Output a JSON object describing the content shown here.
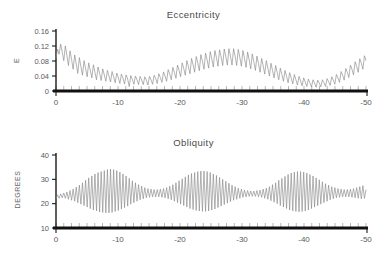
{
  "figure": {
    "background": "#ffffff",
    "curve_color": "#8a8a8a",
    "axis_color": "#111111",
    "text_color": "#5a5a5a"
  },
  "panels": [
    {
      "id": "eccentricity",
      "title": "Eccentricity",
      "ylabel": "E",
      "yticks": [
        "0",
        "0.04",
        "0.08",
        "0.12",
        "0.16"
      ],
      "xticks": [
        "0",
        "-10",
        "-20",
        "-30",
        "-40",
        "-50"
      ]
    },
    {
      "id": "obliquity",
      "title": "Obliquity",
      "ylabel": "DEGREES",
      "yticks": [
        "10",
        "20",
        "30",
        "40"
      ],
      "xticks": [
        "0",
        "-10",
        "-20",
        "-30",
        "-40",
        "-50"
      ]
    }
  ],
  "chart_data": [
    {
      "type": "line",
      "title": "Eccentricity",
      "xlabel": "",
      "ylabel": "E",
      "xlim": [
        0,
        -50
      ],
      "ylim": [
        0,
        0.16
      ],
      "yticks": [
        0,
        0.04,
        0.08,
        0.12,
        0.16
      ],
      "xticks": [
        0,
        -10,
        -20,
        -30,
        -40,
        -50
      ],
      "grid": false,
      "legend": "none",
      "series": [
        {
          "name": "Eccentricity",
          "x_start": 0,
          "x_end": -50,
          "x_step": -0.25,
          "values": [
            0.088,
            0.112,
            0.098,
            0.125,
            0.104,
            0.081,
            0.12,
            0.095,
            0.068,
            0.107,
            0.084,
            0.058,
            0.096,
            0.072,
            0.047,
            0.089,
            0.065,
            0.042,
            0.081,
            0.06,
            0.038,
            0.075,
            0.055,
            0.035,
            0.07,
            0.05,
            0.03,
            0.064,
            0.047,
            0.028,
            0.059,
            0.043,
            0.026,
            0.055,
            0.04,
            0.024,
            0.052,
            0.038,
            0.022,
            0.048,
            0.036,
            0.02,
            0.045,
            0.034,
            0.019,
            0.043,
            0.032,
            0.012,
            0.041,
            0.031,
            0.018,
            0.04,
            0.03,
            0.017,
            0.039,
            0.029,
            0.017,
            0.038,
            0.029,
            0.016,
            0.039,
            0.03,
            0.018,
            0.042,
            0.033,
            0.02,
            0.046,
            0.036,
            0.023,
            0.051,
            0.04,
            0.026,
            0.057,
            0.045,
            0.03,
            0.063,
            0.05,
            0.034,
            0.069,
            0.055,
            0.038,
            0.075,
            0.06,
            0.042,
            0.081,
            0.065,
            0.046,
            0.087,
            0.07,
            0.05,
            0.092,
            0.075,
            0.054,
            0.097,
            0.079,
            0.058,
            0.101,
            0.083,
            0.061,
            0.105,
            0.086,
            0.064,
            0.108,
            0.089,
            0.066,
            0.11,
            0.091,
            0.068,
            0.112,
            0.092,
            0.069,
            0.113,
            0.093,
            0.069,
            0.113,
            0.092,
            0.068,
            0.111,
            0.09,
            0.066,
            0.108,
            0.087,
            0.063,
            0.104,
            0.083,
            0.059,
            0.099,
            0.078,
            0.055,
            0.093,
            0.073,
            0.05,
            0.087,
            0.067,
            0.045,
            0.081,
            0.061,
            0.04,
            0.074,
            0.055,
            0.035,
            0.068,
            0.049,
            0.03,
            0.061,
            0.044,
            0.026,
            0.055,
            0.039,
            0.022,
            0.049,
            0.034,
            0.019,
            0.044,
            0.03,
            0.016,
            0.039,
            0.027,
            0.014,
            0.035,
            0.024,
            0.012,
            0.032,
            0.022,
            0.011,
            0.03,
            0.021,
            0.01,
            0.029,
            0.021,
            0.011,
            0.03,
            0.022,
            0.012,
            0.033,
            0.025,
            0.015,
            0.038,
            0.029,
            0.018,
            0.044,
            0.035,
            0.023,
            0.052,
            0.042,
            0.029,
            0.06,
            0.05,
            0.036,
            0.069,
            0.058,
            0.043,
            0.078,
            0.066,
            0.05,
            0.086,
            0.074,
            0.058,
            0.094,
            0.081
          ]
        }
      ]
    },
    {
      "type": "line",
      "title": "Obliquity",
      "xlabel": "",
      "ylabel": "DEGREES",
      "xlim": [
        0,
        -50
      ],
      "ylim": [
        10,
        40
      ],
      "yticks": [
        10,
        20,
        30,
        40
      ],
      "xticks": [
        0,
        -10,
        -20,
        -30,
        -40,
        -50
      ],
      "grid": false,
      "legend": "none",
      "series": [
        {
          "name": "Obliquity",
          "x_start": 0,
          "x_end": -50,
          "x_step": -0.25,
          "units": "degrees",
          "mean": 24.0,
          "amplitude_range": [
            16.0,
            34.5
          ],
          "values": [
            22.0,
            23.6,
            22.2,
            24.0,
            22.4,
            24.4,
            22.2,
            24.8,
            21.8,
            25.4,
            21.4,
            26.0,
            21.0,
            26.8,
            20.4,
            27.6,
            19.8,
            28.6,
            19.2,
            29.6,
            18.6,
            30.6,
            18.0,
            31.4,
            17.4,
            32.2,
            17.0,
            32.8,
            16.6,
            33.2,
            16.4,
            33.6,
            16.2,
            34.0,
            16.2,
            34.2,
            16.4,
            34.0,
            16.8,
            33.6,
            17.2,
            33.0,
            17.8,
            32.2,
            18.4,
            31.4,
            19.0,
            30.4,
            19.8,
            29.4,
            20.4,
            28.6,
            21.0,
            27.8,
            21.6,
            27.2,
            22.0,
            26.6,
            22.4,
            26.2,
            22.6,
            26.0,
            22.8,
            25.8,
            22.8,
            25.8,
            22.8,
            26.0,
            22.6,
            26.2,
            22.4,
            26.6,
            22.0,
            27.2,
            21.6,
            27.8,
            21.0,
            28.6,
            20.4,
            29.4,
            19.8,
            30.2,
            19.2,
            31.0,
            18.6,
            31.8,
            18.0,
            32.4,
            17.6,
            32.8,
            17.2,
            33.2,
            17.0,
            33.4,
            16.8,
            33.4,
            16.8,
            33.2,
            17.0,
            32.8,
            17.4,
            32.2,
            17.8,
            31.6,
            18.4,
            30.8,
            19.0,
            30.0,
            19.6,
            29.2,
            20.2,
            28.4,
            20.8,
            27.6,
            21.4,
            27.0,
            21.8,
            26.4,
            22.2,
            26.0,
            22.6,
            25.6,
            22.8,
            25.4,
            23.0,
            25.2,
            23.0,
            25.2,
            23.0,
            25.4,
            22.8,
            25.6,
            22.6,
            26.0,
            22.2,
            26.4,
            21.8,
            27.0,
            21.2,
            27.8,
            20.6,
            28.6,
            20.0,
            29.6,
            19.2,
            30.4,
            18.6,
            31.2,
            18.0,
            32.0,
            17.4,
            32.6,
            17.0,
            33.0,
            16.8,
            33.2,
            16.6,
            33.2,
            16.8,
            33.0,
            17.0,
            32.6,
            17.4,
            32.0,
            18.0,
            31.4,
            18.6,
            30.6,
            19.2,
            29.8,
            19.8,
            29.0,
            20.4,
            28.2,
            21.0,
            27.6,
            21.6,
            27.0,
            22.0,
            26.6,
            22.4,
            26.2,
            22.6,
            26.0,
            22.8,
            25.8,
            22.8,
            25.8,
            22.8,
            26.0,
            22.6,
            26.2,
            22.4,
            26.6,
            22.2,
            27.0,
            22.0,
            27.4,
            22.2,
            25.8
          ]
        }
      ]
    }
  ]
}
